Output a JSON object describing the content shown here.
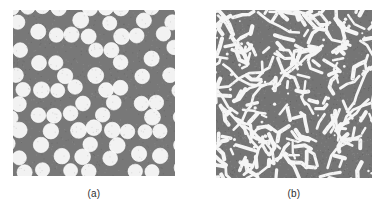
{
  "figure": {
    "background_color": "#ffffff",
    "panels": [
      {
        "id": "a",
        "caption": "(a)",
        "kind": "micrograph",
        "description": "densely packed white circular particles on gray matrix",
        "matrix_color": "#787878",
        "particle_color": "#f2f2f2",
        "particle_edge_color": "#ffffff",
        "x": 13,
        "y": 10,
        "width": 162,
        "height": 166,
        "particle_shape": "circle",
        "particle_diameter": 15,
        "particle_count": 120
      },
      {
        "id": "b",
        "caption": "(b)",
        "kind": "micrograph",
        "description": "sparse white rod and worm shaped particles on gray matrix",
        "matrix_color": "#757575",
        "particle_color": "#f5f5f5",
        "particle_edge_color": "#ffffff",
        "x": 216,
        "y": 10,
        "width": 156,
        "height": 168,
        "particle_shape": "rod",
        "particle_length": 9,
        "particle_thickness": 3,
        "particle_count": 185
      }
    ]
  },
  "chart_data": {
    "type": "scatter",
    "title": "",
    "xlabel": "",
    "ylabel": "",
    "panels": [
      {
        "label": "(a)",
        "series_name": "circular particles",
        "marker": "circle",
        "marker_size_px": 15,
        "fill_color": "#f2f2f2",
        "background_color": "#787878",
        "n_points": 120,
        "area_fraction": 0.62,
        "xlim": [
          0,
          162
        ],
        "ylim": [
          0,
          166
        ],
        "grid": false
      },
      {
        "label": "(b)",
        "series_name": "rod-shaped particles",
        "marker": "rod",
        "marker_length_px": 9,
        "marker_width_px": 3,
        "fill_color": "#f5f5f5",
        "background_color": "#757575",
        "n_points": 185,
        "area_fraction": 0.11,
        "xlim": [
          0,
          156
        ],
        "ylim": [
          0,
          168
        ],
        "grid": false
      }
    ],
    "legend_position": "none"
  }
}
